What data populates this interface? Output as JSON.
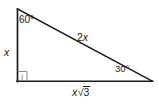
{
  "figure": {
    "type": "right-triangle-30-60-90",
    "background_color": "#ffffff",
    "stroke_color": "#1a1a1a",
    "vertices": {
      "apex_top_left": [
        17,
        9
      ],
      "right_angle_bottom_left": [
        17,
        81
      ],
      "bottom_right": [
        152,
        81
      ]
    },
    "angles": {
      "apex": {
        "value": "60",
        "degree_symbol": "°",
        "label": "60°",
        "at_vertex": "apex_top_left"
      },
      "bottom_right": {
        "value": "30",
        "degree_symbol": "°",
        "label": "30°",
        "at_vertex": "bottom_right"
      },
      "bottom_left": {
        "value": "90",
        "label": "right-angle-mark",
        "at_vertex": "right_angle_bottom_left"
      }
    },
    "sides": {
      "left_leg": {
        "label": "x",
        "italic": true,
        "opposite_angle": "30"
      },
      "hypotenuse": {
        "coefficient": "2",
        "variable": "x",
        "label": "2x",
        "opposite_angle": "90"
      },
      "base_leg": {
        "variable": "x",
        "radical_sign": "√",
        "radicand": "3",
        "label": "x√3",
        "opposite_angle": "60"
      }
    }
  }
}
